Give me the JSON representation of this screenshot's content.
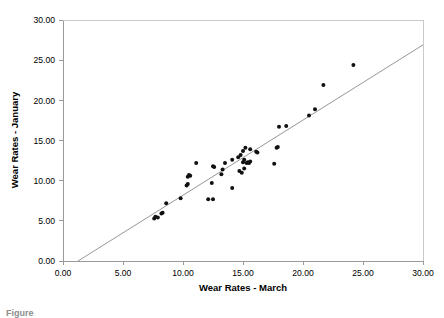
{
  "figure": {
    "caption_fragment": "Figure",
    "background_color": "#ffffff"
  },
  "chart_data": {
    "type": "scatter",
    "title": "",
    "xlabel": "Wear Rates - March",
    "ylabel": "Wear Rates - January",
    "xlim": [
      0,
      30
    ],
    "ylim": [
      0,
      30
    ],
    "xticks": [
      0,
      5,
      10,
      15,
      20,
      25,
      30
    ],
    "yticks": [
      0,
      5,
      10,
      15,
      20,
      25,
      30
    ],
    "xtick_labels": [
      "0.00",
      "5.00",
      "10.00",
      "15.00",
      "20.00",
      "25.00",
      "30.00"
    ],
    "ytick_labels": [
      "0.00",
      "5.00",
      "10.00",
      "15.00",
      "20.00",
      "25.00",
      "30.00"
    ],
    "grid": false,
    "legend": false,
    "legend_position": "none",
    "marker": {
      "shape": "circle",
      "color": "#111111",
      "size_px": 2.0
    },
    "reference_line": {
      "label": "identity-trend-line",
      "color": "#8a8a8a",
      "x_start": 1.25,
      "y_start": 0.0,
      "x_end": 30.0,
      "y_end": 26.9
    },
    "points": [
      {
        "x": 7.6,
        "y": 5.3
      },
      {
        "x": 7.7,
        "y": 5.5
      },
      {
        "x": 7.9,
        "y": 5.4
      },
      {
        "x": 8.2,
        "y": 5.9
      },
      {
        "x": 8.3,
        "y": 6.0
      },
      {
        "x": 8.6,
        "y": 7.2
      },
      {
        "x": 9.8,
        "y": 7.8
      },
      {
        "x": 10.3,
        "y": 9.4
      },
      {
        "x": 10.4,
        "y": 9.6
      },
      {
        "x": 10.4,
        "y": 10.5
      },
      {
        "x": 10.5,
        "y": 10.7
      },
      {
        "x": 10.6,
        "y": 10.6
      },
      {
        "x": 11.1,
        "y": 12.2
      },
      {
        "x": 12.1,
        "y": 7.7
      },
      {
        "x": 12.5,
        "y": 7.7
      },
      {
        "x": 12.4,
        "y": 9.7
      },
      {
        "x": 12.5,
        "y": 11.8
      },
      {
        "x": 12.6,
        "y": 11.7
      },
      {
        "x": 13.2,
        "y": 10.8
      },
      {
        "x": 13.3,
        "y": 11.4
      },
      {
        "x": 13.5,
        "y": 12.2
      },
      {
        "x": 14.1,
        "y": 9.1
      },
      {
        "x": 14.1,
        "y": 12.6
      },
      {
        "x": 14.6,
        "y": 12.9
      },
      {
        "x": 14.7,
        "y": 11.2
      },
      {
        "x": 14.8,
        "y": 13.2
      },
      {
        "x": 14.9,
        "y": 11.0
      },
      {
        "x": 15.0,
        "y": 12.3
      },
      {
        "x": 15.0,
        "y": 13.7
      },
      {
        "x": 15.1,
        "y": 12.6
      },
      {
        "x": 15.1,
        "y": 11.5
      },
      {
        "x": 15.2,
        "y": 14.1
      },
      {
        "x": 15.3,
        "y": 12.2
      },
      {
        "x": 15.4,
        "y": 12.3
      },
      {
        "x": 15.5,
        "y": 12.2
      },
      {
        "x": 15.6,
        "y": 12.4
      },
      {
        "x": 15.6,
        "y": 13.9
      },
      {
        "x": 16.1,
        "y": 13.6
      },
      {
        "x": 16.2,
        "y": 13.5
      },
      {
        "x": 17.6,
        "y": 12.1
      },
      {
        "x": 17.8,
        "y": 14.1
      },
      {
        "x": 17.9,
        "y": 14.2
      },
      {
        "x": 18.0,
        "y": 16.7
      },
      {
        "x": 18.6,
        "y": 16.8
      },
      {
        "x": 20.5,
        "y": 18.1
      },
      {
        "x": 21.0,
        "y": 18.9
      },
      {
        "x": 21.7,
        "y": 21.9
      },
      {
        "x": 24.2,
        "y": 24.4
      }
    ]
  }
}
